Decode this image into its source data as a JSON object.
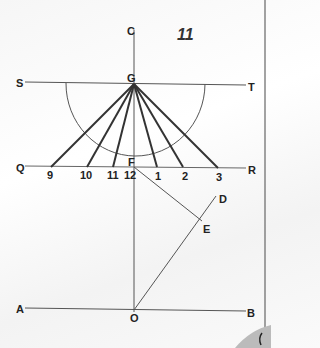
{
  "figure_number": "11",
  "points": {
    "C": "C",
    "G": "G",
    "S": "S",
    "T": "T",
    "Q": "Q",
    "R": "R",
    "F": "F",
    "D": "D",
    "E": "E",
    "A": "A",
    "B": "B",
    "O": "O"
  },
  "hour_labels": [
    "9",
    "10",
    "11",
    "12",
    "1",
    "2",
    "3"
  ],
  "colors": {
    "line": "#444444",
    "hour_line": "#333333",
    "arc": "#555555"
  }
}
